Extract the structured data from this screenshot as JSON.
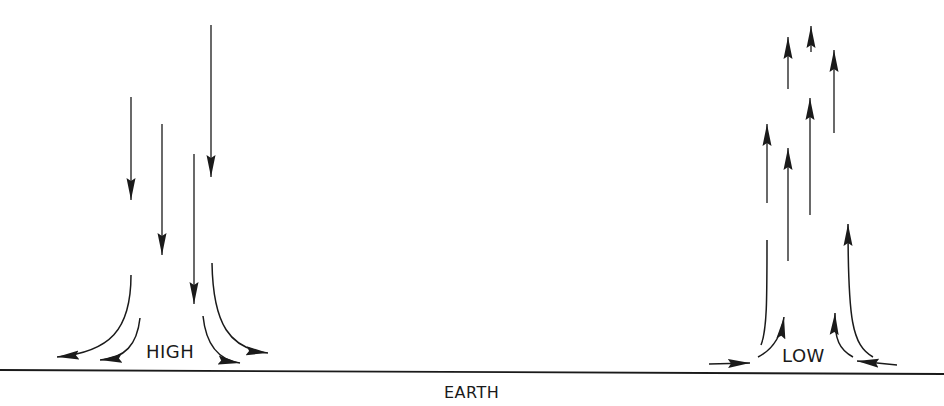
{
  "diagram": {
    "type": "air-circulation",
    "labels": {
      "high": "HIGH",
      "low": "LOW",
      "ground": "EARTH"
    },
    "high_pressure": {
      "description": "Descending air diverging outward near the surface",
      "vertical_arrows_direction": "down",
      "vertical_arrow_count": 4,
      "surface_flow": "outward",
      "surface_arrow_count": 4
    },
    "low_pressure": {
      "description": "Converging surface air rising upward",
      "vertical_arrows_direction": "up",
      "vertical_arrow_count": 7,
      "surface_flow": "inward",
      "surface_arrow_count": 4
    },
    "colors": {
      "stroke": "#1a1a1a",
      "background": "#ffffff"
    }
  }
}
